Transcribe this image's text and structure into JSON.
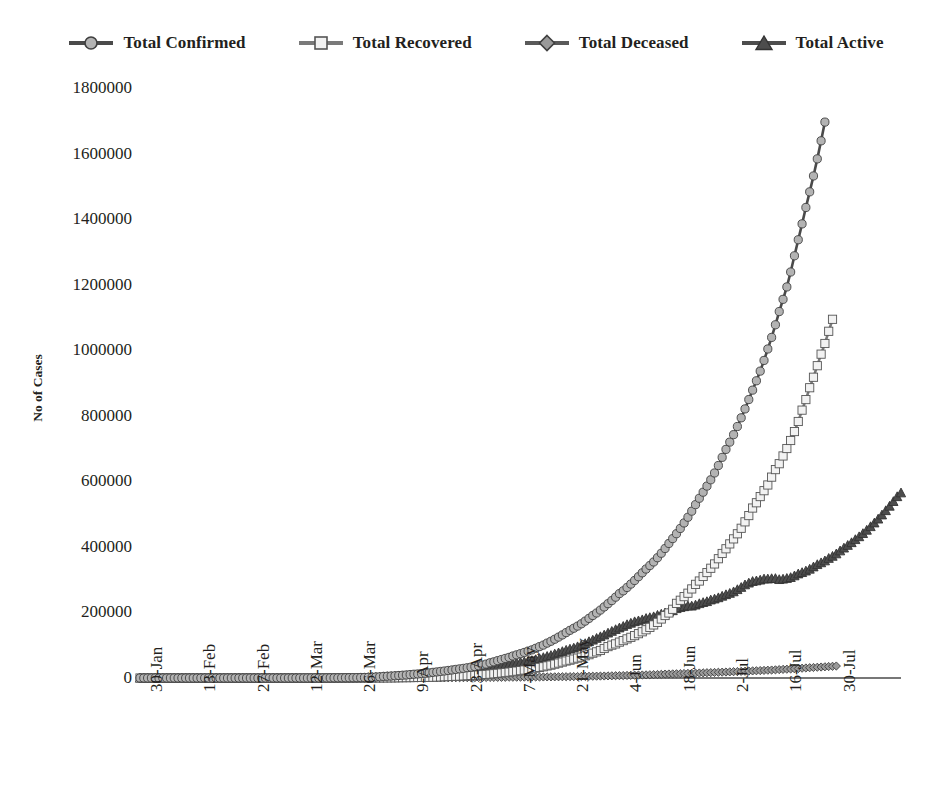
{
  "chart_data": {
    "type": "line",
    "title": "",
    "xlabel": "",
    "ylabel": "No of Cases",
    "ylim": [
      0,
      1800000
    ],
    "ytick_values": [
      0,
      200000,
      400000,
      600000,
      800000,
      1000000,
      1200000,
      1400000,
      1600000,
      1800000
    ],
    "ytick_labels": [
      "0",
      "200000",
      "400000",
      "600000",
      "800000",
      "1000000",
      "1200000",
      "1400000",
      "1600000",
      "1800000"
    ],
    "grid": false,
    "legend_position": "top",
    "x_start_date": "30-Jan",
    "x_end_date": "30-Jul",
    "x_tick_interval_days": 14,
    "xtick_labels": [
      "30-Jan",
      "13-Feb",
      "27-Feb",
      "12-Mar",
      "26-Mar",
      "9-Apr",
      "23-Apr",
      "7-May",
      "21-May",
      "4-Jun",
      "18-Jun",
      "2-Jul",
      "16-Jul",
      "30-Jul"
    ],
    "n_points": 183,
    "marker_every": 1,
    "series": [
      {
        "name": "Total Confirmed",
        "marker": "circle",
        "marker_fill": "#b3b3b3",
        "marker_stroke": "#3f3f3f",
        "line_color": "#4a4a4a",
        "final_value": 1695000,
        "values": [
          1,
          1,
          1,
          2,
          3,
          3,
          3,
          3,
          3,
          3,
          3,
          3,
          3,
          3,
          3,
          3,
          3,
          3,
          3,
          3,
          3,
          3,
          3,
          3,
          3,
          3,
          3,
          3,
          3,
          3,
          3,
          5,
          5,
          6,
          28,
          30,
          31,
          34,
          39,
          48,
          63,
          70,
          81,
          91,
          110,
          125,
          150,
          180,
          223,
          283,
          360,
          434,
          519,
          606,
          694,
          834,
          918,
          1024,
          1251,
          1397,
          1998,
          2543,
          3082,
          3588,
          4778,
          5311,
          5916,
          6725,
          7598,
          8446,
          9205,
          10453,
          11487,
          12322,
          13430,
          14352,
          15712,
          17265,
          18539,
          20080,
          21370,
          23077,
          24506,
          26283,
          27890,
          29451,
          31324,
          33062,
          34863,
          37257,
          39699,
          42505,
          46437,
          49400,
          52987,
          56351,
          59695,
          62939,
          67152,
          70756,
          74281,
          78055,
          81997,
          85784,
          90648,
          95698,
          100328,
          106475,
          112028,
          118226,
          124794,
          131423,
          138536,
          145380,
          151767,
          158333,
          165386,
          173491,
          181827,
          190609,
          198370,
          207191,
          216824,
          226713,
          236184,
          246622,
          257486,
          265928,
          276146,
          286605,
          297535,
          308993,
          320922,
          332424,
          343091,
          354065,
          366946,
          380532,
          395048,
          410461,
          425282,
          440215,
          456183,
          473105,
          490401,
          508953,
          528859,
          548318,
          566840,
          585481,
          604641,
          625544,
          648315,
          673165,
          697413,
          719665,
          742417,
          767296,
          793802,
          820916,
          849522,
          878254,
          906752,
          936181,
          968857,
          1003832,
          1039084,
          1077618,
          1118043,
          1155191,
          1193078,
          1238635,
          1288108,
          1337024,
          1385522,
          1435453,
          1483156,
          1531669,
          1583792,
          1638870,
          1695988
        ]
      },
      {
        "name": "Total Recovered",
        "marker": "square",
        "marker_fill": "#f2f2f2",
        "marker_stroke": "#555555",
        "line_color": "#7a7a7a",
        "final_value": 1094374,
        "values": [
          0,
          0,
          0,
          0,
          0,
          0,
          0,
          0,
          0,
          0,
          0,
          0,
          0,
          0,
          0,
          0,
          0,
          0,
          0,
          0,
          0,
          0,
          0,
          0,
          0,
          0,
          0,
          0,
          0,
          0,
          0,
          0,
          0,
          0,
          3,
          3,
          3,
          3,
          3,
          4,
          4,
          4,
          4,
          4,
          10,
          13,
          14,
          15,
          20,
          22,
          23,
          27,
          40,
          44,
          44,
          66,
          78,
          95,
          101,
          124,
          148,
          183,
          229,
          267,
          375,
          421,
          506,
          619,
          774,
          979,
          1080,
          1181,
          1359,
          1768,
          1768,
          2041,
          2231,
          2463,
          2854,
          3273,
          3975,
          4370,
          4749,
          5498,
          5804,
          6523,
          7137,
          7747,
          8437,
          9065,
          9951,
          10887,
          11775,
          12847,
          14183,
          15267,
          16540,
          17887,
          19301,
          20969,
          22549,
          24420,
          26400,
          27969,
          30158,
          32329,
          34224,
          36795,
          39234,
          42297,
          45422,
          48553,
          51824,
          54385,
          57692,
          60706,
          63624,
          67749,
          71106,
          75807,
          79766,
          83975,
          89995,
          95754,
          100285,
          104071,
          109462,
          114073,
          119293,
          124094,
          129214,
          135206,
          141029,
          147195,
          154330,
          161908,
          169798,
          180013,
          190621,
          198399,
          209693,
          227755,
          237195,
          248190,
          258685,
          271697,
          285637,
          295881,
          309713,
          321723,
          334822,
          347978,
          363870,
          379891,
          394227,
          409083,
          424433,
          439948,
          456831,
          476378,
          495513,
          518531,
          534621,
          553471,
          571459,
          588868,
          612814,
          635757,
          653751,
          677423,
          700087,
          724578,
          751885,
          782606,
          817209,
          849431,
          885577,
          917568,
          952743,
          988029,
          1020582,
          1057805,
          1094374
        ]
      },
      {
        "name": "Total Deceased",
        "marker": "diamond",
        "marker_fill": "#9a9a9a",
        "marker_stroke": "#3f3f3f",
        "line_color": "#5a5a5a",
        "final_value": 36511,
        "values": [
          0,
          0,
          0,
          0,
          0,
          0,
          0,
          0,
          0,
          0,
          0,
          0,
          0,
          0,
          0,
          0,
          0,
          0,
          0,
          0,
          0,
          0,
          0,
          0,
          0,
          0,
          0,
          0,
          0,
          0,
          0,
          0,
          0,
          0,
          0,
          0,
          0,
          1,
          1,
          1,
          2,
          2,
          2,
          2,
          2,
          3,
          3,
          4,
          5,
          6,
          7,
          9,
          10,
          12,
          13,
          19,
          19,
          27,
          32,
          35,
          47,
          56,
          72,
          86,
          124,
          149,
          169,
          206,
          239,
          288,
          331,
          358,
          393,
          414,
          486,
          521,
          559,
          592,
          652,
          686,
          721,
          775,
          825,
          872,
          939,
          1008,
          1079,
          1152,
          1223,
          1323,
          1391,
          1566,
          1694,
          1785,
          1889,
          1985,
          2109,
          2212,
          2294,
          2415,
          2551,
          2649,
          2752,
          2871,
          2987,
          3029,
          3156,
          3303,
          3435,
          3584,
          3720,
          3867,
          3985,
          4172,
          4344,
          4534,
          4711,
          4980,
          5185,
          5394,
          5608,
          5829,
          6075,
          6363,
          6649,
          6946,
          7207,
          7473,
          7745,
          8102,
          8498,
          8884,
          9195,
          9520,
          9900,
          10299,
          10699,
          11133,
          11903,
          12237,
          12573,
          12948,
          13254,
          13699,
          14011,
          14476,
          14894,
          15301,
          15685,
          16095,
          16475,
          16893,
          17400,
          17834,
          18213,
          18655,
          19268,
          19693,
          20160,
          20642,
          21129,
          21604,
          22123,
          22674,
          23187,
          23727,
          24309,
          24915,
          25602,
          26273,
          26816,
          27497,
          28084,
          28732,
          29861,
          30601,
          31358,
          32063,
          32771,
          33425,
          34193,
          34968,
          35747,
          36511
        ]
      },
      {
        "name": "Total Active",
        "marker": "triangle",
        "marker_fill": "#4d4d4d",
        "marker_stroke": "#333333",
        "line_color": "#4d4d4d",
        "final_value": 565103,
        "values": [
          1,
          1,
          1,
          2,
          3,
          3,
          3,
          3,
          3,
          3,
          3,
          3,
          3,
          3,
          3,
          3,
          3,
          3,
          3,
          3,
          3,
          3,
          3,
          3,
          3,
          3,
          3,
          3,
          3,
          3,
          3,
          5,
          5,
          6,
          25,
          27,
          28,
          30,
          35,
          43,
          57,
          64,
          75,
          85,
          98,
          109,
          133,
          161,
          198,
          255,
          330,
          398,
          469,
          550,
          637,
          749,
          821,
          902,
          1118,
          1238,
          1803,
          2304,
          2781,
          3235,
          4279,
          4741,
          5241,
          5900,
          6585,
          7179,
          7794,
          8914,
          9735,
          10140,
          11176,
          11818,
          12871,
          14072,
          14912,
          16022,
          16900,
          17779,
          18544,
          19664,
          20514,
          21439,
          22810,
          23990,
          25337,
          26743,
          27781,
          29573,
          31859,
          33609,
          35905,
          37914,
          39785,
          41590,
          44237,
          46222,
          48152,
          49986,
          52057,
          53696,
          56461,
          59747,
          62801,
          66380,
          69138,
          73572,
          77148,
          81089,
          85188,
          88502,
          91604,
          95792,
          100470,
          105401,
          111306,
          115942,
          121370,
          126431,
          131499,
          137457,
          142695,
          148091,
          153140,
          157926,
          163228,
          167604,
          172101,
          174837,
          178094,
          182146,
          184652,
          187328,
          191718,
          195248,
          199212,
          201836,
          205802,
          212047,
          215263,
          217958,
          220244,
          219859,
          223050,
          227267,
          230704,
          233465,
          238461,
          241384,
          245293,
          249983,
          254566,
          258685,
          263425,
          270010,
          276809,
          284644,
          290045,
          294945,
          296812,
          299143,
          302545,
          302549,
          303556,
          303920,
          300723,
          302065,
          304222,
          306943,
          312079,
          317957,
          322106,
          326817,
          332437,
          339286,
          346341,
          351948,
          357763,
          365340,
          371717,
          379180,
          388174,
          396832,
          404987,
          413268,
          422634,
          431385,
          441070,
          451306,
          462140,
          473437,
          485295,
          497818,
          510901,
          524519,
          538783,
          553627,
          565103
        ]
      }
    ]
  },
  "legend": {
    "items": [
      {
        "label": "Total Confirmed",
        "marker": "circle"
      },
      {
        "label": "Total Recovered",
        "marker": "square"
      },
      {
        "label": "Total Deceased",
        "marker": "diamond"
      },
      {
        "label": "Total Active",
        "marker": "triangle"
      }
    ]
  },
  "colors": {
    "background": "#ffffff",
    "text": "#231f20",
    "axis": "#4a4a4a",
    "confirmed": "#b3b3b3",
    "recovered": "#f2f2f2",
    "deceased": "#9a9a9a",
    "active": "#4d4d4d"
  }
}
